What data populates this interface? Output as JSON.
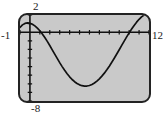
{
  "graph": {
    "device": "graphing-calculator-screen",
    "labels": {
      "ymax": "2",
      "ymin": "-8",
      "xmin": "-1",
      "xmax": "12"
    },
    "colors": {
      "screen_background": "#c9c9c9",
      "screen_border": "#232323",
      "curve": "#111111",
      "axis": "#111111",
      "page_background": "#ffffff"
    }
  },
  "chart_data": {
    "type": "line",
    "title": "",
    "xlabel": "",
    "ylabel": "",
    "xlim": [
      -1,
      12
    ],
    "ylim": [
      -8,
      2
    ],
    "grid": false,
    "legend": null,
    "axes": {
      "x_axis_at_y": 0,
      "y_axis_at_x": 0,
      "x_tick_step": 1,
      "y_tick_step": 1,
      "tick_marks": true
    },
    "annotations": [
      {
        "text": "2",
        "role": "ymax-label",
        "position": "top-of-y-axis"
      },
      {
        "text": "-8",
        "role": "ymin-label",
        "position": "bottom-of-y-axis"
      },
      {
        "text": "-1",
        "role": "xmin-label",
        "position": "left-of-x-axis"
      },
      {
        "text": "12",
        "role": "xmax-label",
        "position": "right-of-x-axis"
      }
    ],
    "series": [
      {
        "name": "curve",
        "x": [
          -1.0,
          -0.75,
          -0.5,
          -0.25,
          0.0,
          0.25,
          0.5,
          0.75,
          1.0,
          1.25,
          1.5,
          1.75,
          2.0,
          2.25,
          2.5,
          2.75,
          3.0,
          3.25,
          3.5,
          3.75,
          4.0,
          4.25,
          4.5,
          4.75,
          5.0,
          5.25,
          5.5,
          5.75,
          6.0,
          6.25,
          6.5,
          6.75,
          7.0,
          7.25,
          7.5,
          7.75,
          8.0,
          8.25,
          8.5,
          8.75,
          9.0,
          9.25,
          9.5,
          9.75,
          10.0,
          10.25,
          10.5,
          10.75,
          11.0,
          11.25,
          11.5,
          11.75,
          12.0
        ],
        "y": [
          0.55,
          0.85,
          1.02,
          1.08,
          1.05,
          0.93,
          0.74,
          0.48,
          0.17,
          -0.2,
          -0.62,
          -1.07,
          -1.55,
          -2.05,
          -2.55,
          -3.05,
          -3.54,
          -4.0,
          -4.43,
          -4.83,
          -5.19,
          -5.5,
          -5.76,
          -5.97,
          -6.12,
          -6.22,
          -6.27,
          -6.26,
          -6.2,
          -6.08,
          -5.91,
          -5.69,
          -5.42,
          -5.11,
          -4.76,
          -4.37,
          -3.95,
          -3.5,
          -3.03,
          -2.54,
          -2.04,
          -1.54,
          -1.04,
          -0.55,
          -0.08,
          0.37,
          0.79,
          1.17,
          1.5,
          1.78,
          1.99,
          2.12,
          2.18
        ],
        "key_points": {
          "local_maximum": {
            "x": -0.25,
            "y": 1.08
          },
          "x_intercepts": [
            1.15,
            10.05
          ],
          "minimum": {
            "x": 5.6,
            "y": -6.27
          }
        }
      }
    ]
  }
}
